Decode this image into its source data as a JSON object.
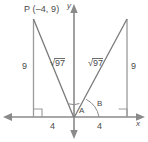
{
  "figure": {
    "background_color": "#ffffff",
    "stroke_color": "#808080",
    "text_color": "#4a4a4a"
  },
  "axes": {
    "x_label": "x",
    "y_label": "y",
    "origin": {
      "x": 74,
      "y": 117
    },
    "x_axis": {
      "x1": 4,
      "y1": 117,
      "x2": 144,
      "y2": 117,
      "arrows": "both"
    },
    "y_axis": {
      "x1": 74,
      "y1": 6,
      "x2": 74,
      "y2": 138,
      "arrows": "both"
    }
  },
  "points": {
    "p_label": "P (–4, 9)",
    "p_x": -4,
    "p_y": 9,
    "p_pixel": {
      "x": 33,
      "y": 19
    },
    "q_pixel": {
      "x": 127,
      "y": 19
    }
  },
  "segments": {
    "left_vertical_label": "9",
    "right_vertical_label": "9",
    "left_base_label": "4",
    "right_base_label": "4",
    "left_hypotenuse_radical": "97",
    "right_hypotenuse_radical": "97",
    "radical_symbol": "√"
  },
  "angles": {
    "a_label": "A",
    "b_label": "B"
  },
  "marks": {
    "right_angle_left": "right-angle",
    "right_angle_right": "right-angle"
  }
}
